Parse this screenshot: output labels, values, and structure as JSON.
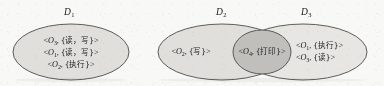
{
  "figure": {
    "type": "venn-domain-diagram",
    "caption": "",
    "colors": {
      "paper": "#fdfdfc",
      "ellipse_fill": "#e4e3df",
      "intersection_fill": "#c3c2bd",
      "stroke": "#4a4a4a",
      "text": "#17171a"
    }
  },
  "domains": [
    {
      "id": "d1",
      "label": "D",
      "subscript": "1",
      "entries": [
        {
          "open": "<",
          "object": "O",
          "object_sub": "3",
          "sep": ", ",
          "rights": "{读，写}",
          "close": ">"
        },
        {
          "open": "<",
          "object": "O",
          "object_sub": "1",
          "sep": ", ",
          "rights": "{读，写}",
          "close": ">"
        },
        {
          "open": "<",
          "object": "O",
          "object_sub": "2",
          "sep": ", ",
          "rights": "{执行}",
          "close": ">"
        }
      ]
    },
    {
      "id": "d2",
      "label": "D",
      "subscript": "2",
      "entries": [
        {
          "open": "<",
          "object": "O",
          "object_sub": "2",
          "sep": ", ",
          "rights": "{写}",
          "close": ">"
        }
      ]
    },
    {
      "id": "d3",
      "label": "D",
      "subscript": "3",
      "entries": [
        {
          "open": "<",
          "object": "O",
          "object_sub": "1",
          "sep": ", ",
          "rights": "{执行}",
          "close": ">"
        },
        {
          "open": "<",
          "object": "O",
          "object_sub": "3",
          "sep": ", ",
          "rights": "{读}",
          "close": ">"
        }
      ]
    }
  ],
  "intersection": {
    "id": "d2-d3-intersection",
    "between": [
      "D2",
      "D3"
    ],
    "entries": [
      {
        "open": "<",
        "object": "O",
        "object_sub": "4",
        "sep": ", ",
        "rights": "{打印}",
        "close": ">"
      }
    ]
  }
}
